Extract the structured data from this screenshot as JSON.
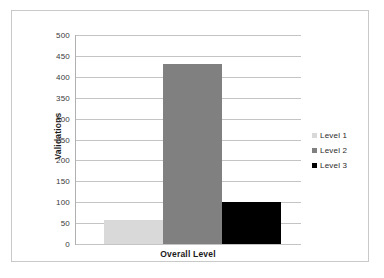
{
  "chart_data": {
    "type": "bar",
    "title": "",
    "subtitle": "",
    "xlabel": "Overall Level",
    "ylabel": "Validations",
    "categories": [
      "Overall Level"
    ],
    "series": [
      {
        "name": "Level 1",
        "values": [
          57
        ],
        "color": "#d9d9d9"
      },
      {
        "name": "Level 2",
        "values": [
          430
        ],
        "color": "#808080"
      },
      {
        "name": "Level 3",
        "values": [
          100
        ],
        "color": "#000000"
      }
    ],
    "ylim": [
      0,
      500
    ],
    "ytick_labels": [
      "500",
      "450",
      "400",
      "350",
      "300",
      "250",
      "200",
      "150",
      "100",
      "50",
      "0"
    ],
    "ytick_values": [
      500,
      450,
      400,
      350,
      300,
      250,
      200,
      150,
      100,
      50,
      0
    ],
    "grid": "horizontal",
    "legend_position": "right",
    "legend_entries": [
      "Level 1",
      "Level 2",
      "Level 3"
    ],
    "annotations": []
  },
  "colors": {
    "level1": "#d9d9d9",
    "level2": "#808080",
    "level3": "#000000",
    "gridline": "#c4c4c4",
    "axis": "#b0b0b0",
    "frame": "#c9c9c9",
    "text": "#1a1a1a",
    "background": "#ffffff"
  }
}
